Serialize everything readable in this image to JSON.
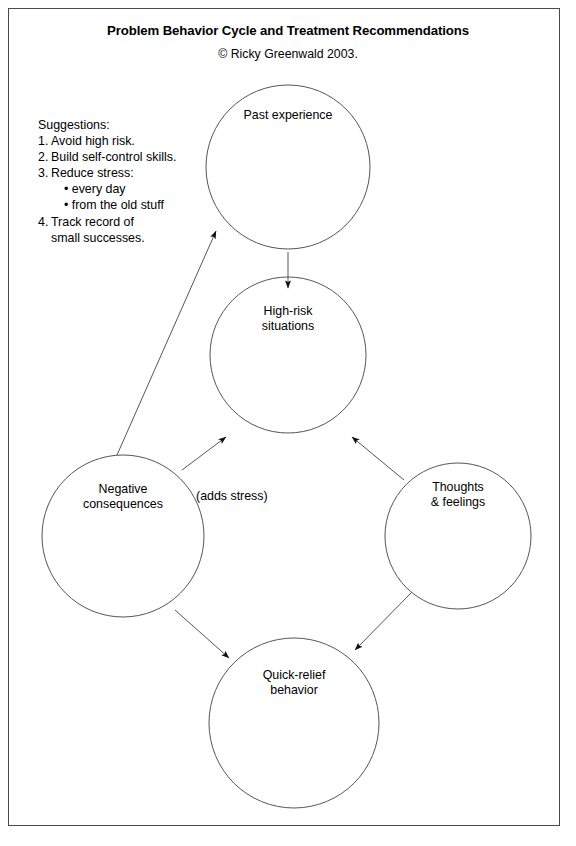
{
  "document": {
    "title": "Problem Behavior Cycle and Treatment Recommendations",
    "copyright": "© Ricky Greenwald 2003."
  },
  "suggestions": {
    "heading": "Suggestions:",
    "items": [
      {
        "number": "1.",
        "text": "Avoid high risk."
      },
      {
        "number": "2.",
        "text": "Build self-control skills."
      },
      {
        "number": "3.",
        "text": "Reduce stress:"
      },
      {
        "number": "4.",
        "text": "Track record of"
      }
    ],
    "bullets": [
      "• every day",
      "• from the old stuff"
    ],
    "item4_continuation": "small successes."
  },
  "diagram": {
    "nodes": [
      {
        "id": "past-experience",
        "label": "Past experience",
        "line1": "Past experience",
        "line2": ""
      },
      {
        "id": "high-risk-situations",
        "label": "High-risk situations",
        "line1": "High-risk",
        "line2": "situations"
      },
      {
        "id": "negative-consequences",
        "label": "Negative consequences",
        "line1": "Negative",
        "line2": "consequences"
      },
      {
        "id": "thoughts-feelings",
        "label": "Thoughts & feelings",
        "line1": "Thoughts",
        "line2": "& feelings"
      },
      {
        "id": "quick-relief-behavior",
        "label": "Quick-relief behavior",
        "line1": "Quick-relief",
        "line2": "behavior"
      }
    ],
    "edge_label": "(adds stress)",
    "edges": [
      {
        "from": "past-experience",
        "to": "high-risk-situations",
        "label": ""
      },
      {
        "from": "high-risk-situations",
        "to": "thoughts-feelings",
        "label": ""
      },
      {
        "from": "thoughts-feelings",
        "to": "quick-relief-behavior",
        "label": ""
      },
      {
        "from": "quick-relief-behavior",
        "to": "negative-consequences",
        "label": ""
      },
      {
        "from": "negative-consequences",
        "to": "high-risk-situations",
        "label": "(adds stress)"
      },
      {
        "from": "negative-consequences",
        "to": "past-experience",
        "label": ""
      }
    ],
    "colors": {
      "stroke": "#555555",
      "arrow": "#111111",
      "frame": "#4a4a4a",
      "text": "#000000",
      "background": "#ffffff"
    }
  }
}
